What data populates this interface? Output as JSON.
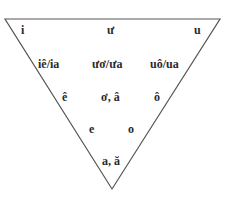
{
  "diagram": {
    "type": "vowel-triangle",
    "shape": "inverted-triangle",
    "line_color": "#555555",
    "text_color": "#2a2a2a",
    "rows": [
      {
        "name": "high",
        "items": [
          {
            "id": "i",
            "label": "i"
          },
          {
            "id": "uw",
            "label": "ư"
          },
          {
            "id": "u",
            "label": "u"
          }
        ]
      },
      {
        "name": "diphthongs",
        "items": [
          {
            "id": "ie",
            "label": "iê/ia"
          },
          {
            "id": "uwo",
            "label": "ươ/ưa"
          },
          {
            "id": "uo",
            "label": "uô/ua"
          }
        ]
      },
      {
        "name": "mid-high",
        "items": [
          {
            "id": "e-circ",
            "label": "ê"
          },
          {
            "id": "o-horn",
            "label": "ơ, â"
          },
          {
            "id": "o-circ",
            "label": "ô"
          }
        ]
      },
      {
        "name": "mid-low",
        "items": [
          {
            "id": "e",
            "label": "e"
          },
          {
            "id": "o",
            "label": "o"
          }
        ]
      },
      {
        "name": "low",
        "items": [
          {
            "id": "a",
            "label": "a, ă"
          }
        ]
      }
    ]
  }
}
